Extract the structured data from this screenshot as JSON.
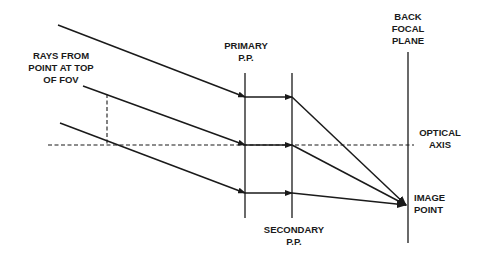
{
  "labels": {
    "rays_source": [
      "RAYS FROM",
      "POINT AT TOP",
      "OF FOV"
    ],
    "primary_pp": [
      "PRIMARY",
      "P.P."
    ],
    "secondary_pp": [
      "SECONDARY",
      "P.P."
    ],
    "back_focal_plane": [
      "BACK",
      "FOCAL",
      "PLANE"
    ],
    "optical_axis": [
      "OPTICAL",
      "AXIS"
    ],
    "image_point": [
      "IMAGE",
      "POINT"
    ]
  },
  "colors": {
    "line": "#1a1a1a",
    "background": "#ffffff"
  },
  "geometry": {
    "primary_pp_x": 245,
    "secondary_pp_x": 292,
    "back_focal_plane_x": 408,
    "optical_axis_y": 145,
    "image_point": [
      406,
      205
    ],
    "rays": [
      {
        "start": [
          58,
          25
        ],
        "primary_y": 97
      },
      {
        "start": [
          83,
          86
        ],
        "primary_y": 145
      },
      {
        "start": [
          60,
          123
        ],
        "primary_y": 193
      }
    ]
  }
}
